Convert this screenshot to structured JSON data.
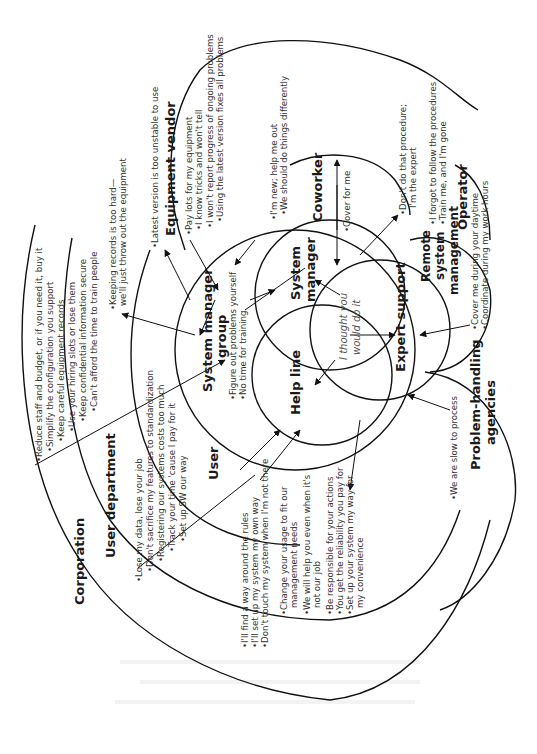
{
  "diagram": {
    "orientation": "rotated 90deg counter-clockwise",
    "rings": {
      "corporation": {
        "label": "Corporation",
        "items": [
          "•Reduce staff and budget, or if you need it, buy it",
          "•Simplify the configuration you support",
          "•Keep careful equipment records",
          "•Use your hiring slots or lose them",
          "•Keep confidential information secure",
          "•Can't afford the time to train people"
        ]
      },
      "user_department": {
        "label": "User department",
        "items": [
          "•Lose my data, lose your job",
          "•Don't sacrifice my features to standardization",
          "•Registering our systems costs too much",
          "•Track your time 'cause I pay for it",
          "•Set up SW our way"
        ]
      },
      "user": {
        "label": "User",
        "items": [
          "•I'll find a way around the rules",
          "•I'll set up my system my own way",
          "•Don't touch my system when I'm not there"
        ],
        "to_user_items": [
          "•Change your usage to fit our",
          "management needs",
          "•We will help you even when it's",
          "not our job",
          "•Be responsible for your actions",
          "•You get the reliability you pay for",
          "•Set up your system my way for",
          "my convenience"
        ]
      },
      "system_manager_group": {
        "label_line1": "System manager",
        "label_line2": "group",
        "items": [
          "•Figure out problems yourself",
          "•No time for training"
        ],
        "records_line1": "•Keeping records is too hard—",
        "records_line2": "we'll just throw out the equipment"
      },
      "equipment_vendor": {
        "label": "Equipment vendor",
        "top_item": "•Latest version is too unstable to use",
        "items": [
          "•Pay lots for my equipment",
          "•I know tricks and won't tell",
          "•I won't report progress of ongoing problems",
          "•Using the latest version fixes all problems"
        ]
      },
      "coworker": {
        "label": "Coworker",
        "items": [
          "•I'm new; help me out",
          "•We should do things differently"
        ],
        "inner_item": "•Cover for me"
      },
      "operator": {
        "label": "Operator",
        "expert_line1": "•Don't do that procedure;",
        "expert_line2": "I'm the expert",
        "items": [
          "•I forgot to follow the procedures",
          "•Train me, and I'm gone"
        ]
      },
      "remote_system_management": {
        "label_line1": "Remote",
        "label_line2": "system",
        "label_line3": "management",
        "items": [
          "•Cover me during your daytime",
          "•Coordinate during my work hours"
        ]
      },
      "problem_handling_agencies": {
        "label_line1": "Problem-handling",
        "label_line2": "agencies",
        "items": [
          "•We are slow to process"
        ]
      }
    },
    "core": {
      "system_manager": {
        "line1": "System",
        "line2": "manager"
      },
      "help_line": {
        "label": "Help line"
      },
      "expert_support": {
        "label": "Expert support"
      },
      "center_text": {
        "line1": "I thought you",
        "line2": "would do it"
      }
    },
    "bleed_through_text": [
      "(faint reverse-page text, illegible)"
    ]
  }
}
